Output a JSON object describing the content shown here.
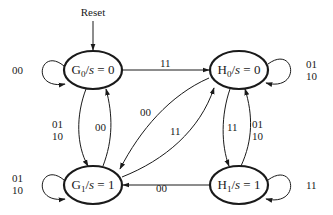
{
  "diagram": {
    "type": "finite-state-machine",
    "reset_label": "Reset",
    "states": [
      {
        "id": "G0",
        "letter": "G",
        "sub": "0",
        "output_var": "s",
        "output_value": "0",
        "label": "G0/s = 0"
      },
      {
        "id": "H0",
        "letter": "H",
        "sub": "0",
        "output_var": "s",
        "output_value": "0",
        "label": "H0/s = 0"
      },
      {
        "id": "G1",
        "letter": "G",
        "sub": "1",
        "output_var": "s",
        "output_value": "1",
        "label": "G1/s = 1"
      },
      {
        "id": "H1",
        "letter": "H",
        "sub": "1",
        "output_var": "s",
        "output_value": "1",
        "label": "H1/s = 1"
      }
    ],
    "initial_state": "G0",
    "transitions": [
      {
        "from": "G0",
        "to": "G0",
        "label_lines": [
          "00"
        ]
      },
      {
        "from": "G0",
        "to": "H0",
        "label_lines": [
          "11"
        ]
      },
      {
        "from": "G0",
        "to": "G1",
        "label_lines": [
          "01",
          "10"
        ]
      },
      {
        "from": "G1",
        "to": "G0",
        "label_lines": [
          "00"
        ]
      },
      {
        "from": "H0",
        "to": "H0",
        "label_lines": [
          "01",
          "10"
        ]
      },
      {
        "from": "H0",
        "to": "G1",
        "label_lines": [
          "00"
        ]
      },
      {
        "from": "G1",
        "to": "H0",
        "label_lines": [
          "11"
        ]
      },
      {
        "from": "H0",
        "to": "H1",
        "label_lines": [
          "11"
        ]
      },
      {
        "from": "H1",
        "to": "H0",
        "label_lines": [
          "01",
          "10"
        ]
      },
      {
        "from": "G1",
        "to": "G1",
        "label_lines": [
          "01",
          "10"
        ]
      },
      {
        "from": "H1",
        "to": "G1",
        "label_lines": [
          "00"
        ]
      },
      {
        "from": "H1",
        "to": "H1",
        "label_lines": [
          "11"
        ]
      }
    ],
    "equals_sign": "="
  }
}
